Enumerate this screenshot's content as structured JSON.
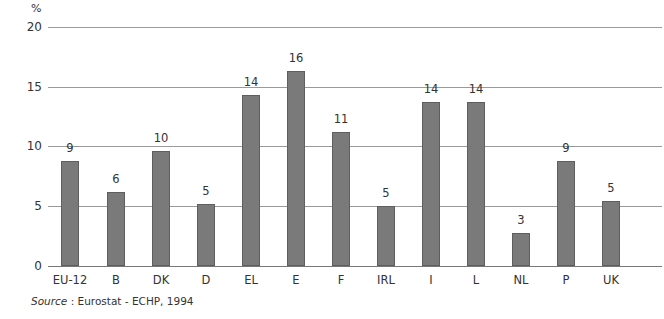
{
  "chart_data": {
    "type": "bar",
    "title": "",
    "ylabel": "%",
    "xlabel": "",
    "ylim": [
      0,
      20
    ],
    "yticks": [
      0,
      5,
      10,
      15,
      20
    ],
    "grid": true,
    "categories": [
      "EU-12",
      "B",
      "DK",
      "D",
      "EL",
      "E",
      "F",
      "IRL",
      "I",
      "L",
      "NL",
      "P",
      "UK"
    ],
    "values": [
      9,
      6,
      10,
      5,
      14,
      16,
      11,
      5,
      14,
      14,
      3,
      9,
      5
    ],
    "bar_heights_estimated": [
      8.8,
      6.2,
      9.7,
      5.2,
      14.4,
      16.4,
      11.3,
      5.0,
      13.8,
      13.8,
      2.8,
      8.8,
      5.5
    ],
    "source": "Source : Eurostat - ECHP, 1994"
  },
  "axis": {
    "unit": "%",
    "ticks": [
      "20",
      "15",
      "10",
      "5",
      "0"
    ]
  },
  "labels": {
    "values": [
      "9",
      "6",
      "10",
      "5",
      "14",
      "16",
      "11",
      "5",
      "14",
      "14",
      "3",
      "9",
      "5"
    ],
    "categories": [
      "EU-12",
      "B",
      "DK",
      "D",
      "EL",
      "E",
      "F",
      "IRL",
      "I",
      "L",
      "NL",
      "P",
      "UK"
    ]
  },
  "source": {
    "prefix": "Source",
    "rest": " : Eurostat - ECHP, 1994"
  }
}
